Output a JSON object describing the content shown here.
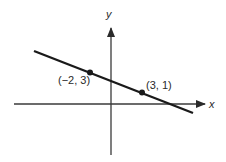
{
  "diagram": {
    "type": "coordinate-plane-line",
    "axes": {
      "x_label": "x",
      "y_label": "y"
    },
    "line": {
      "description": "straight line passing through two labeled points",
      "color": "#1a1a1a"
    },
    "points": [
      {
        "label": "(−2, 3)",
        "x": -2,
        "y": 3
      },
      {
        "label": "(3, 1)",
        "x": 3,
        "y": 1
      }
    ]
  }
}
